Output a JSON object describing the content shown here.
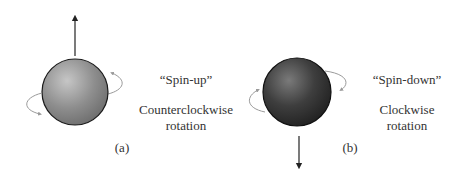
{
  "panels": [
    {
      "id": "a",
      "panel_label": "(a)",
      "state_name": "“Spin-up”",
      "rotation_line1": "Counterclockwise",
      "rotation_line2": "rotation",
      "sphere_color": "#8a8a8a",
      "arrow_direction": "up"
    },
    {
      "id": "b",
      "panel_label": "(b)",
      "state_name": "“Spin-down”",
      "rotation_line1": "Clockwise",
      "rotation_line2": "rotation",
      "sphere_color": "#3a3a3a",
      "arrow_direction": "down"
    }
  ],
  "colors": {
    "background": "#ffffff",
    "text": "#333333",
    "rotation_arrow": "#9a9a9a",
    "spin_arrow": "#222222"
  }
}
